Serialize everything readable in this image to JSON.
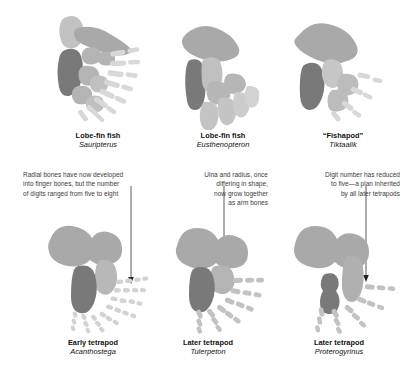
{
  "figure": {
    "background": "#ffffff",
    "palette": {
      "bone_dark": "#797979",
      "bone_mid": "#a9a9a9",
      "bone_light": "#c9c9c9",
      "bone_pale": "#dadada",
      "text": "#111111",
      "note_text": "#3a3a3a",
      "leader_line": "#333333"
    }
  },
  "specimens": [
    {
      "id": "sauripterus",
      "common_name": "Lobe-fin fish",
      "genus": "Sauripterus",
      "row": "top",
      "column": 1,
      "digit_description": "many slender radials fanning out"
    },
    {
      "id": "eusthenopteron",
      "common_name": "Lobe-fin fish",
      "genus": "Eusthenopteron",
      "row": "top",
      "column": 2,
      "digit_description": "few broad distal elements"
    },
    {
      "id": "tiktaalik",
      "common_name": "“Fishapod”",
      "genus": "Tiktaalik",
      "row": "top",
      "column": 3,
      "digit_description": "short blunt distal radials"
    },
    {
      "id": "acanthostega",
      "common_name": "Early tetrapod",
      "genus": "Acanthostega",
      "row": "bottom",
      "column": 1,
      "digit_description": "eight digits of small segments"
    },
    {
      "id": "tulerpeton",
      "common_name": "Later tetrapod",
      "genus": "Tulerpeton",
      "row": "bottom",
      "column": 2,
      "digit_description": "six digits"
    },
    {
      "id": "proterogyrinus",
      "common_name": "Later tetrapod",
      "genus": "Proterogyrinus",
      "row": "bottom",
      "column": 3,
      "digit_description": "five digits"
    }
  ],
  "annotations": [
    {
      "id": "radials-to-fingers",
      "align": "left",
      "lines": [
        "Radial bones have now developed",
        "into finger bones, but the number",
        "of digits ranged from five to eight"
      ],
      "points_to": "acanthostega"
    },
    {
      "id": "ulna-radius-fusion",
      "align": "right",
      "lines": [
        "Ulna and radius, once",
        "differing in shape,",
        "now grow together",
        "as arm bones"
      ],
      "points_to": "tulerpeton"
    },
    {
      "id": "digit-reduction",
      "align": "right",
      "lines": [
        "Digit number has reduced",
        "to five—a plan inherited",
        "by all later tetrapods"
      ],
      "points_to": "proterogyrinus"
    }
  ]
}
